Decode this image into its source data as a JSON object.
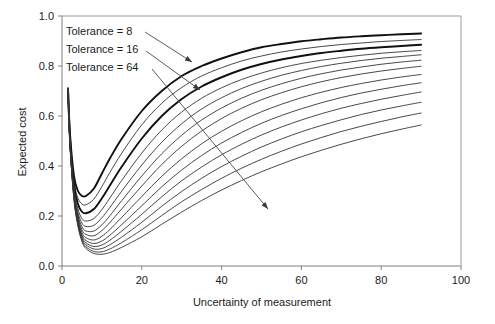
{
  "chart_data": {
    "type": "line",
    "title": "",
    "xlabel": "Uncertainty of measurement",
    "ylabel": "Expected cost",
    "xlim": [
      0,
      100
    ],
    "ylim": [
      0,
      1.0
    ],
    "xticks": [
      0,
      20,
      40,
      60,
      80,
      100
    ],
    "xtick_labels": [
      "0",
      "20",
      "40",
      "60",
      "80",
      "100"
    ],
    "yticks": [
      0.0,
      0.2,
      0.4,
      0.6,
      0.8,
      1.0
    ],
    "ytick_labels": [
      "0.0",
      "0.2",
      "0.4",
      "0.6",
      "0.8",
      "1.0"
    ],
    "grid": false,
    "legend_position": "none",
    "x": [
      1.5,
      2,
      3,
      4,
      5,
      6,
      8,
      10,
      12,
      15,
      20,
      25,
      30,
      35,
      40,
      45,
      50,
      55,
      60,
      65,
      70,
      75,
      80,
      85,
      90
    ],
    "series": [
      {
        "name": "Tolerance = 8",
        "emphasis": "bold",
        "values": [
          0.71,
          0.53,
          0.36,
          0.3,
          0.28,
          0.28,
          0.31,
          0.37,
          0.43,
          0.51,
          0.62,
          0.7,
          0.76,
          0.8,
          0.83,
          0.855,
          0.875,
          0.888,
          0.899,
          0.907,
          0.914,
          0.919,
          0.923,
          0.927,
          0.93
        ]
      },
      {
        "name": "Tolerance = 11",
        "emphasis": "normal",
        "values": [
          0.71,
          0.52,
          0.34,
          0.272,
          0.248,
          0.245,
          0.268,
          0.318,
          0.374,
          0.452,
          0.565,
          0.651,
          0.714,
          0.76,
          0.793,
          0.82,
          0.84,
          0.856,
          0.868,
          0.878,
          0.886,
          0.892,
          0.898,
          0.902,
          0.906
        ]
      },
      {
        "name": "Tolerance = 16",
        "emphasis": "bold",
        "values": [
          0.71,
          0.51,
          0.325,
          0.248,
          0.217,
          0.211,
          0.228,
          0.271,
          0.322,
          0.398,
          0.51,
          0.6,
          0.668,
          0.718,
          0.755,
          0.785,
          0.808,
          0.826,
          0.84,
          0.852,
          0.861,
          0.869,
          0.875,
          0.88,
          0.885
        ]
      },
      {
        "name": "Tolerance = 20",
        "emphasis": "normal",
        "values": [
          0.71,
          0.505,
          0.313,
          0.228,
          0.19,
          0.18,
          0.19,
          0.226,
          0.272,
          0.343,
          0.452,
          0.544,
          0.616,
          0.671,
          0.713,
          0.746,
          0.772,
          0.793,
          0.81,
          0.823,
          0.834,
          0.843,
          0.851,
          0.857,
          0.862
        ]
      },
      {
        "name": "Tolerance = 24",
        "emphasis": "normal",
        "values": [
          0.71,
          0.5,
          0.305,
          0.215,
          0.172,
          0.158,
          0.163,
          0.193,
          0.234,
          0.3,
          0.404,
          0.495,
          0.569,
          0.628,
          0.673,
          0.71,
          0.739,
          0.763,
          0.782,
          0.798,
          0.811,
          0.822,
          0.831,
          0.838,
          0.845
        ]
      },
      {
        "name": "Tolerance = 28",
        "emphasis": "normal",
        "values": [
          0.71,
          0.497,
          0.298,
          0.204,
          0.157,
          0.14,
          0.14,
          0.165,
          0.201,
          0.262,
          0.36,
          0.449,
          0.523,
          0.584,
          0.632,
          0.671,
          0.703,
          0.729,
          0.751,
          0.769,
          0.784,
          0.796,
          0.807,
          0.816,
          0.823
        ]
      },
      {
        "name": "Tolerance = 32",
        "emphasis": "normal",
        "values": [
          0.71,
          0.494,
          0.292,
          0.196,
          0.145,
          0.126,
          0.121,
          0.142,
          0.174,
          0.229,
          0.32,
          0.406,
          0.479,
          0.54,
          0.59,
          0.631,
          0.665,
          0.693,
          0.717,
          0.737,
          0.754,
          0.768,
          0.78,
          0.79,
          0.799
        ]
      },
      {
        "name": "Tolerance = 38",
        "emphasis": "normal",
        "values": [
          0.71,
          0.491,
          0.286,
          0.188,
          0.134,
          0.113,
          0.104,
          0.119,
          0.146,
          0.195,
          0.278,
          0.359,
          0.429,
          0.489,
          0.539,
          0.581,
          0.617,
          0.647,
          0.673,
          0.695,
          0.714,
          0.73,
          0.744,
          0.756,
          0.766
        ]
      },
      {
        "name": "Tolerance = 44",
        "emphasis": "normal",
        "values": [
          0.71,
          0.489,
          0.281,
          0.181,
          0.125,
          0.102,
          0.09,
          0.1,
          0.123,
          0.166,
          0.241,
          0.317,
          0.384,
          0.442,
          0.492,
          0.534,
          0.571,
          0.602,
          0.629,
          0.653,
          0.674,
          0.692,
          0.707,
          0.721,
          0.733
        ]
      },
      {
        "name": "Tolerance = 52",
        "emphasis": "normal",
        "values": [
          0.71,
          0.487,
          0.277,
          0.175,
          0.118,
          0.093,
          0.078,
          0.084,
          0.103,
          0.14,
          0.207,
          0.277,
          0.341,
          0.396,
          0.445,
          0.487,
          0.524,
          0.556,
          0.584,
          0.609,
          0.631,
          0.65,
          0.667,
          0.682,
          0.696
        ]
      },
      {
        "name": "Tolerance = 64",
        "emphasis": "normal",
        "values": [
          0.71,
          0.485,
          0.273,
          0.17,
          0.111,
          0.085,
          0.068,
          0.07,
          0.085,
          0.116,
          0.175,
          0.239,
          0.298,
          0.351,
          0.398,
          0.439,
          0.476,
          0.508,
          0.537,
          0.562,
          0.585,
          0.606,
          0.624,
          0.64,
          0.655
        ]
      },
      {
        "name": "Tolerance = 80",
        "emphasis": "normal",
        "values": [
          0.71,
          0.483,
          0.269,
          0.164,
          0.104,
          0.077,
          0.058,
          0.057,
          0.068,
          0.094,
          0.145,
          0.202,
          0.257,
          0.306,
          0.351,
          0.391,
          0.427,
          0.459,
          0.488,
          0.514,
          0.538,
          0.559,
          0.578,
          0.596,
          0.612
        ]
      },
      {
        "name": "Tolerance = 104",
        "emphasis": "normal",
        "values": [
          0.71,
          0.481,
          0.265,
          0.159,
          0.098,
          0.07,
          0.05,
          0.047,
          0.054,
          0.075,
          0.117,
          0.167,
          0.216,
          0.262,
          0.304,
          0.342,
          0.377,
          0.408,
          0.437,
          0.463,
          0.487,
          0.509,
          0.529,
          0.547,
          0.564
        ]
      }
    ],
    "annotations": [
      {
        "id": "tolerance-8",
        "text": "Tolerance =   8",
        "label_x_px": 66,
        "label_y_px": 35,
        "arrow_from": [
          145,
          32
        ],
        "arrow_to": [
          192,
          62
        ]
      },
      {
        "id": "tolerance-16",
        "text": "Tolerance = 16",
        "label_x_px": 66,
        "label_y_px": 53,
        "arrow_from": [
          146,
          51
        ],
        "arrow_to": [
          200,
          90
        ]
      },
      {
        "id": "tolerance-64",
        "text": "Tolerance = 64",
        "label_x_px": 66,
        "label_y_px": 71,
        "arrow_from": [
          152,
          69
        ],
        "arrow_to": [
          268,
          209
        ]
      }
    ]
  },
  "colors": {
    "curve": "#333333",
    "curve_bold": "#111111",
    "axis": "#808080",
    "frame": "#9a9a9a",
    "text": "#1a1a1a",
    "background": "#ffffff"
  }
}
